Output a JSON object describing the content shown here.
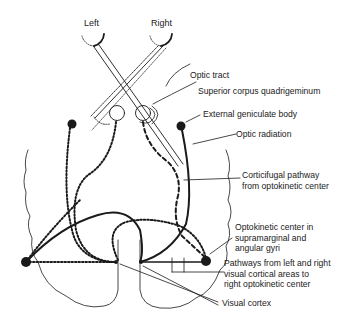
{
  "diagram": {
    "eyes": [
      {
        "id": "left",
        "label": "Left"
      },
      {
        "id": "right",
        "label": "Right"
      }
    ],
    "labels": {
      "optic_tract": "Optic tract",
      "superior_corpus": "Superior corpus quadrigeminum",
      "external_geniculate": "External geniculate body",
      "optic_radiation": "Optic radiation",
      "corticifugal": "Corticifugal pathway\nfrom optokinetic center",
      "optokinetic_center": "Optokinetic center in\nsupramarginal and\nangular gyri",
      "pathways": "Pathways from left and right\nvisual cortical areas to\nright optokinetic center",
      "visual_cortex": "Visual cortex"
    },
    "legend_styles": {
      "solid_thick": "Optic radiation (right)",
      "dotted": "Left hemisphere pathways",
      "dashed": "Corticifugal pathway"
    },
    "colors": {
      "ink": "#1a1a1a",
      "background": "#ffffff"
    }
  }
}
